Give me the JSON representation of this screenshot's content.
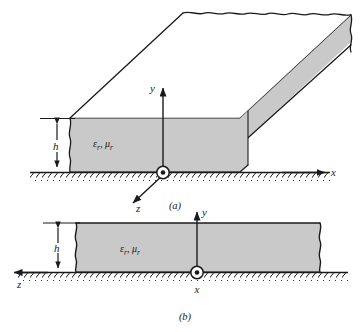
{
  "figure": {
    "panels": [
      {
        "id": "a",
        "caption": "(a)",
        "view": "three-dimensional perspective",
        "material_label": "ε",
        "material_label_sub1": "r",
        "material_label_sep": ", μ",
        "material_label_sub2": "r",
        "material_label_full": "εr, μr",
        "thickness_label": "h",
        "axes": [
          {
            "name": "x",
            "label": "x",
            "direction": "right"
          },
          {
            "name": "y",
            "label": "y",
            "direction": "up"
          },
          {
            "name": "z",
            "label": "z",
            "direction": "out-of-page-lower-left"
          }
        ],
        "origin_symbol": "circle-dot"
      },
      {
        "id": "b",
        "caption": "(b)",
        "view": "cross-section",
        "material_label": "ε",
        "material_label_sub1": "r",
        "material_label_sep": ", μ",
        "material_label_sub2": "r",
        "material_label_full": "εr, μr",
        "thickness_label": "h",
        "axes": [
          {
            "name": "z",
            "label": "z",
            "direction": "left"
          },
          {
            "name": "y",
            "label": "y",
            "direction": "up"
          },
          {
            "name": "x",
            "label": "x",
            "direction": "out-of-page"
          }
        ],
        "origin_symbol": "circle-dot"
      }
    ],
    "colors": {
      "slab_fill": "#c9c9c9",
      "slab_top_fill": "#ffffff",
      "outline": "#1a1a1a",
      "background": "#ffffff",
      "hatch": "#1a1a1a"
    }
  }
}
